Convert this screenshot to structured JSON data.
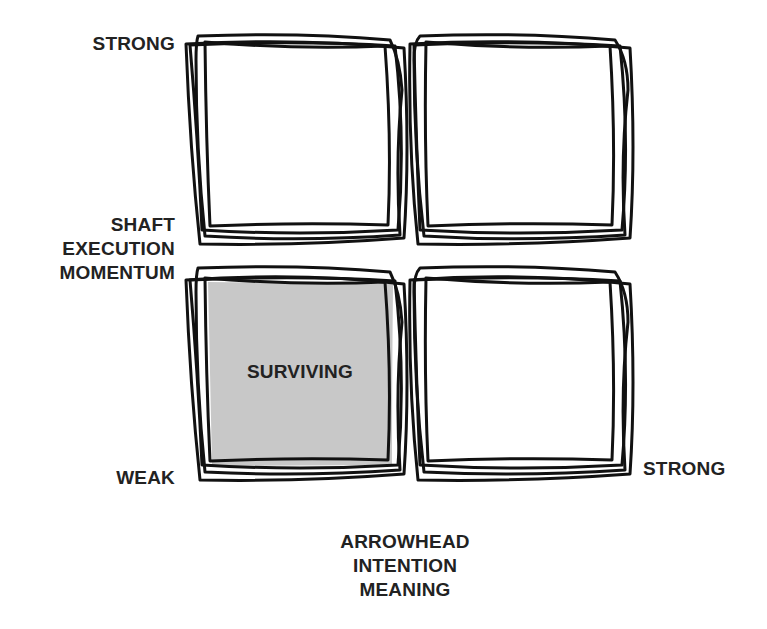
{
  "diagram": {
    "type": "2x2-matrix",
    "y_axis": {
      "top_label": "STRONG",
      "middle_label_lines": [
        "SHAFT",
        "EXECUTION",
        "MOMENTUM"
      ],
      "bottom_label": "WEAK"
    },
    "x_axis": {
      "right_label": "STRONG",
      "bottom_label_lines": [
        "ARROWHEAD",
        "INTENTION",
        "MEANING"
      ]
    },
    "quadrants": [
      {
        "position": "top-left",
        "label": "",
        "shaded": false
      },
      {
        "position": "top-right",
        "label": "",
        "shaded": false
      },
      {
        "position": "bottom-left",
        "label": "SURVIVING",
        "shaded": true
      },
      {
        "position": "bottom-right",
        "label": "",
        "shaded": false
      }
    ],
    "colors": {
      "stroke": "#111111",
      "shade": "#c8c8c8",
      "text": "#222222",
      "background": "#ffffff"
    }
  }
}
